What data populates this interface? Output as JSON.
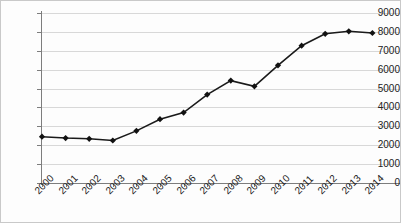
{
  "chart_data": {
    "type": "line",
    "title": "",
    "subtitle": "",
    "xlabel": "",
    "ylabel": "",
    "categories": [
      "2000",
      "2001",
      "2002",
      "2003",
      "2004",
      "2005",
      "2006",
      "2007",
      "2008",
      "2009",
      "2010",
      "2011",
      "2012",
      "2013",
      "2014"
    ],
    "values": [
      2450,
      2380,
      2340,
      2250,
      2760,
      3380,
      3730,
      4680,
      5420,
      5120,
      6230,
      7270,
      7900,
      8030,
      7940
    ],
    "series": [
      {
        "name": "Series 1",
        "values": [
          2450,
          2380,
          2340,
          2250,
          2760,
          3380,
          3730,
          4680,
          5420,
          5120,
          6230,
          7270,
          7900,
          8030,
          7940
        ]
      }
    ],
    "ylim": [
      0,
      9000
    ],
    "y_ticks": [
      0,
      1000,
      2000,
      3000,
      4000,
      5000,
      6000,
      7000,
      8000,
      9000
    ],
    "y_tick_labels": [
      "0",
      "1000",
      "2000",
      "3000",
      "4000",
      "5000",
      "6000",
      "7000",
      "8000",
      "9000"
    ],
    "x_tick_labels": [
      "2000",
      "2001",
      "2002",
      "2003",
      "2004",
      "2005",
      "2006",
      "2007",
      "2008",
      "2009",
      "2010",
      "2011",
      "2012",
      "2013",
      "2014"
    ],
    "grid": "horizontal",
    "legend": "none",
    "marker_style": "diamond",
    "line_color": "#1a1a1a",
    "marker_color": "#121212",
    "grid_color": "#d8d8d8",
    "axis_color": "#7d7d7d",
    "background_color": "#fdfdfd"
  }
}
